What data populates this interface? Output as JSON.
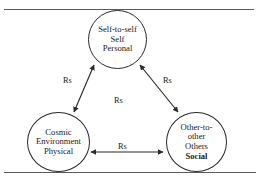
{
  "figure": {
    "nodes": [
      {
        "id": "self",
        "name": "self-node",
        "lines": [
          {
            "text": "Self-to-self",
            "bold": false
          },
          {
            "text": "Self",
            "bold": false
          },
          {
            "text": "Personal",
            "bold": false
          }
        ]
      },
      {
        "id": "cosmic",
        "name": "cosmic-node",
        "lines": [
          {
            "text": "Cosmic",
            "bold": false
          },
          {
            "text": "Environment",
            "bold": false
          },
          {
            "text": "Physical",
            "bold": false
          }
        ]
      },
      {
        "id": "other",
        "name": "other-node",
        "lines": [
          {
            "text": "Other-to-",
            "bold": false
          },
          {
            "text": "other",
            "bold": false
          },
          {
            "text": "Others",
            "bold": false
          },
          {
            "text": "Social",
            "bold": true
          }
        ]
      }
    ],
    "edges": {
      "left_label": "Rs",
      "right_label": "Rs",
      "center_label": "Rs",
      "bottom_label": "Rs"
    },
    "colors": {
      "stroke": "#2a2a2a",
      "rule": "#5b5b5b",
      "background": "#ffffff"
    }
  }
}
